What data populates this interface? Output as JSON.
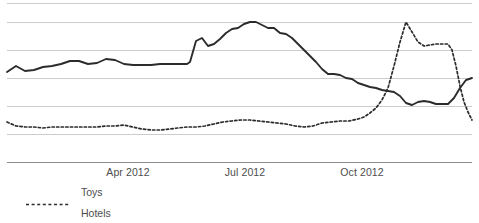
{
  "chart_data": {
    "type": "line",
    "title": "",
    "xlabel": "",
    "ylabel": "",
    "grid": true,
    "gridlines_y": [
      3,
      22,
      50,
      78,
      106,
      134,
      162
    ],
    "legend_position": "bottom-left",
    "x_tick_labels": [
      "Apr 2012",
      "Jul 2012",
      "Oct 2012"
    ],
    "x_tick_positions": [
      128,
      245,
      362
    ],
    "axis_line_y": 162,
    "plot_left": 7,
    "plot_right": 472,
    "series": [
      {
        "name": "Toys",
        "style": "dotted",
        "color": "#2b2b2b",
        "points": [
          [
            7,
            122
          ],
          [
            16,
            126
          ],
          [
            25,
            127
          ],
          [
            34,
            127
          ],
          [
            43,
            128
          ],
          [
            52,
            127
          ],
          [
            61,
            127
          ],
          [
            70,
            127
          ],
          [
            79,
            127
          ],
          [
            88,
            127
          ],
          [
            97,
            127
          ],
          [
            106,
            126
          ],
          [
            115,
            126
          ],
          [
            124,
            125
          ],
          [
            133,
            127
          ],
          [
            142,
            129
          ],
          [
            151,
            130
          ],
          [
            160,
            130
          ],
          [
            169,
            129
          ],
          [
            178,
            128
          ],
          [
            187,
            127
          ],
          [
            196,
            127
          ],
          [
            205,
            126
          ],
          [
            214,
            124
          ],
          [
            223,
            122
          ],
          [
            232,
            121
          ],
          [
            241,
            120
          ],
          [
            250,
            120
          ],
          [
            259,
            121
          ],
          [
            268,
            122
          ],
          [
            277,
            123
          ],
          [
            286,
            124
          ],
          [
            295,
            126
          ],
          [
            304,
            127
          ],
          [
            313,
            126
          ],
          [
            322,
            123
          ],
          [
            331,
            122
          ],
          [
            340,
            121
          ],
          [
            349,
            121
          ],
          [
            358,
            119
          ],
          [
            364,
            117
          ],
          [
            370,
            113
          ],
          [
            376,
            108
          ],
          [
            382,
            100
          ],
          [
            388,
            88
          ],
          [
            394,
            66
          ],
          [
            400,
            42
          ],
          [
            406,
            22
          ],
          [
            412,
            32
          ],
          [
            418,
            42
          ],
          [
            424,
            46
          ],
          [
            430,
            45
          ],
          [
            436,
            44
          ],
          [
            442,
            44
          ],
          [
            448,
            44
          ],
          [
            452,
            50
          ],
          [
            456,
            66
          ],
          [
            460,
            86
          ],
          [
            464,
            102
          ],
          [
            468,
            112
          ],
          [
            472,
            120
          ]
        ]
      },
      {
        "name": "Hotels",
        "style": "solid",
        "color": "#2b2b2b",
        "points": [
          [
            7,
            72
          ],
          [
            16,
            66
          ],
          [
            25,
            71
          ],
          [
            34,
            70
          ],
          [
            43,
            67
          ],
          [
            52,
            66
          ],
          [
            61,
            64
          ],
          [
            70,
            61
          ],
          [
            79,
            61
          ],
          [
            88,
            64
          ],
          [
            97,
            63
          ],
          [
            106,
            59
          ],
          [
            115,
            60
          ],
          [
            124,
            64
          ],
          [
            133,
            65
          ],
          [
            142,
            65
          ],
          [
            151,
            65
          ],
          [
            160,
            64
          ],
          [
            169,
            64
          ],
          [
            178,
            64
          ],
          [
            187,
            64
          ],
          [
            190,
            62
          ],
          [
            196,
            41
          ],
          [
            202,
            38
          ],
          [
            208,
            46
          ],
          [
            214,
            44
          ],
          [
            220,
            39
          ],
          [
            226,
            33
          ],
          [
            232,
            29
          ],
          [
            238,
            28
          ],
          [
            244,
            24
          ],
          [
            250,
            22
          ],
          [
            256,
            22
          ],
          [
            262,
            25
          ],
          [
            268,
            28
          ],
          [
            274,
            28
          ],
          [
            280,
            33
          ],
          [
            286,
            34
          ],
          [
            292,
            38
          ],
          [
            298,
            44
          ],
          [
            304,
            50
          ],
          [
            310,
            56
          ],
          [
            316,
            62
          ],
          [
            322,
            69
          ],
          [
            328,
            74
          ],
          [
            334,
            74
          ],
          [
            340,
            75
          ],
          [
            346,
            78
          ],
          [
            352,
            79
          ],
          [
            358,
            83
          ],
          [
            364,
            85
          ],
          [
            370,
            87
          ],
          [
            376,
            88
          ],
          [
            382,
            90
          ],
          [
            388,
            91
          ],
          [
            394,
            92
          ],
          [
            400,
            96
          ],
          [
            406,
            103
          ],
          [
            412,
            105
          ],
          [
            418,
            102
          ],
          [
            424,
            101
          ],
          [
            430,
            102
          ],
          [
            436,
            104
          ],
          [
            442,
            104
          ],
          [
            448,
            104
          ],
          [
            454,
            98
          ],
          [
            460,
            88
          ],
          [
            466,
            80
          ],
          [
            472,
            78
          ]
        ]
      }
    ]
  },
  "legend": {
    "items": [
      {
        "label": "Toys",
        "style": "dotted"
      },
      {
        "label": "Hotels",
        "style": "solid"
      }
    ]
  },
  "colors": {
    "gridline": "#cccccc",
    "axis": "#8c8c8c",
    "line": "#2b2b2b",
    "text": "#4d4d4d",
    "background": "#ffffff"
  }
}
